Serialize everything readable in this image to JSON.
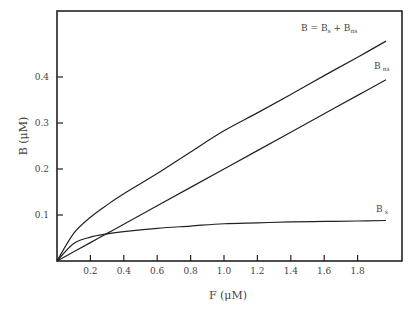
{
  "chart_data": {
    "type": "line",
    "title": "",
    "xlabel": "F (μM)",
    "ylabel": "B (μM)",
    "xlim": [
      0,
      2.08
    ],
    "ylim": [
      0,
      0.54
    ],
    "x_ticks": [
      "0.2",
      "0.4",
      "0.6",
      "0.8",
      "1.0",
      "1.2",
      "1.4",
      "1.6",
      "1.8"
    ],
    "y_ticks": [
      "0.1",
      "0.2",
      "0.3",
      "0.4"
    ],
    "grid": false,
    "legend": "inline labels at curve ends",
    "x": [
      0,
      0.1,
      0.2,
      0.3,
      0.4,
      0.6,
      0.8,
      1.0,
      1.2,
      1.4,
      1.6,
      1.8,
      1.97
    ],
    "series": [
      {
        "name": "B = Bs + Bns",
        "label_main": "B = B",
        "label_sub1": "s",
        "label_plus": " + B",
        "label_sub2": "ns",
        "values": [
          0,
          0.06,
          0.095,
          0.122,
          0.146,
          0.19,
          0.237,
          0.283,
          0.322,
          0.362,
          0.403,
          0.443,
          0.478
        ]
      },
      {
        "name": "Bns",
        "label_main": "B",
        "label_sub": "ns",
        "values": [
          0,
          0.02,
          0.04,
          0.06,
          0.08,
          0.12,
          0.16,
          0.2,
          0.24,
          0.28,
          0.32,
          0.36,
          0.394
        ]
      },
      {
        "name": "Bs",
        "label_main": "B",
        "label_sub": "s",
        "values": [
          0,
          0.038,
          0.052,
          0.059,
          0.064,
          0.071,
          0.076,
          0.081,
          0.083,
          0.085,
          0.086,
          0.087,
          0.088
        ]
      }
    ]
  }
}
